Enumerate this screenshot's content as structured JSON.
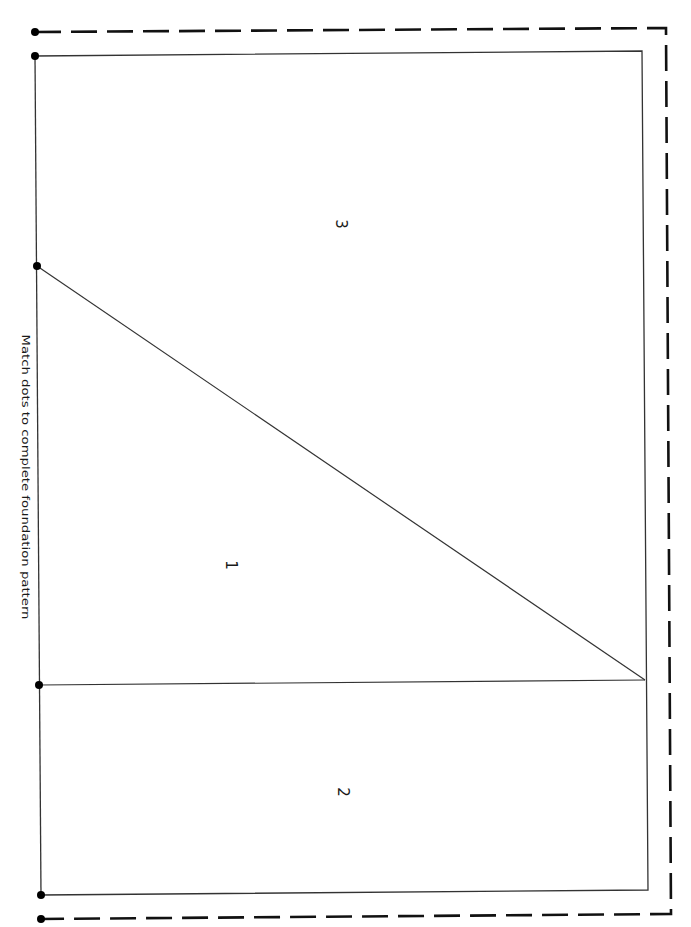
{
  "diagram": {
    "type": "foundation-paper-piecing-pattern",
    "instruction": "Match dots to complete foundation pattern",
    "sections": [
      {
        "id": "section-3",
        "label": "3",
        "x": 340,
        "y": 224
      },
      {
        "id": "section-1",
        "label": "1",
        "x": 230,
        "y": 565
      },
      {
        "id": "section-2",
        "label": "2",
        "x": 342,
        "y": 792
      }
    ],
    "colors": {
      "line": "#222222",
      "dashed": "#111111",
      "dot": "#000000",
      "background": "#ffffff"
    },
    "match_dots": [
      {
        "x": 35,
        "y": 32
      },
      {
        "x": 35,
        "y": 56
      },
      {
        "x": 37,
        "y": 266
      },
      {
        "x": 39,
        "y": 685
      },
      {
        "x": 41,
        "y": 895
      },
      {
        "x": 41,
        "y": 919
      }
    ]
  }
}
